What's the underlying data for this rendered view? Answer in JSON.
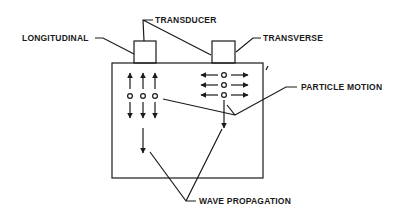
{
  "diagram": {
    "colors": {
      "ink": "#1a1a1a",
      "background": "#ffffff"
    },
    "labels": {
      "longitudinal": "LONGITUDINAL",
      "transducer": "TRANSDUCER",
      "transverse": "TRANSVERSE",
      "particle_motion": "PARTICLE MOTION",
      "wave_propagation": "WAVE PROPAGATION"
    },
    "components": [
      {
        "id": "specimen-block",
        "shape": "rectangle"
      },
      {
        "id": "longitudinal-transducer",
        "shape": "rectangle"
      },
      {
        "id": "transverse-transducer",
        "shape": "rectangle"
      },
      {
        "id": "longitudinal-particles",
        "count": 3,
        "motion": "vertical double arrows"
      },
      {
        "id": "transverse-particles",
        "count": 3,
        "motion": "horizontal double arrows"
      }
    ]
  }
}
